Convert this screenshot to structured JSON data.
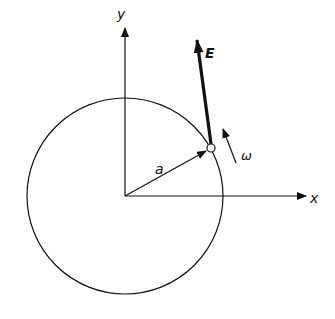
{
  "diagram": {
    "labels": {
      "y_axis": "y",
      "x_axis": "x",
      "field": "E",
      "radius": "a",
      "angular_velocity": "ω"
    },
    "colors": {
      "ink": "#111111",
      "background": "#ffffff"
    }
  }
}
